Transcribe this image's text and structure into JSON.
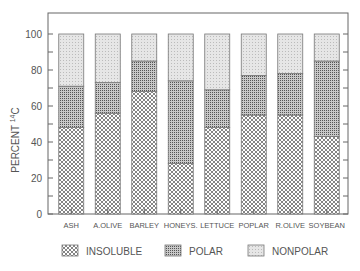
{
  "chart_data": {
    "type": "bar",
    "stacked": true,
    "title": "",
    "xlabel": "",
    "ylabel": "PERCENT ¹⁴C",
    "ylim": [
      0,
      110
    ],
    "yticks": [
      0,
      20,
      40,
      60,
      80,
      100
    ],
    "categories": [
      "ASH",
      "A.OLIVE",
      "BARLEY",
      "HONEYS.",
      "LETTUCE",
      "POPLAR",
      "R.OLIVE",
      "SOYBEAN"
    ],
    "series": [
      {
        "name": "INSOLUBLE",
        "values": [
          48,
          56,
          68,
          28,
          48,
          55,
          55,
          43
        ]
      },
      {
        "name": "POLAR",
        "values": [
          23,
          17,
          17,
          46,
          21,
          22,
          23,
          42
        ]
      },
      {
        "name": "NONPOLAR",
        "values": [
          29,
          27,
          15,
          26,
          31,
          23,
          22,
          15
        ]
      }
    ],
    "legend_position": "bottom",
    "grid": false
  },
  "axis": {
    "ylabel": "PERCENT",
    "ylabel_sup": "14",
    "ylabel_suffix": "C"
  },
  "legend": [
    {
      "label": "INSOLUBLE"
    },
    {
      "label": "POLAR"
    },
    {
      "label": "NONPOLAR"
    }
  ]
}
